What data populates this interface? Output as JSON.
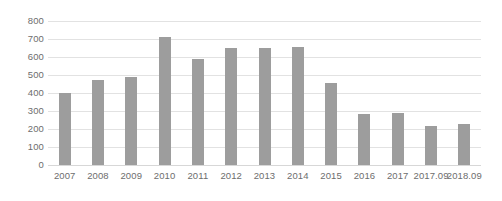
{
  "chart_data": {
    "type": "bar",
    "title": "",
    "subtitle": "",
    "xlabel": "",
    "ylabel": "",
    "categories": [
      "2007",
      "2008",
      "2009",
      "2010",
      "2011",
      "2012",
      "2013",
      "2014",
      "2015",
      "2016",
      "2017",
      "2017.09",
      "2018.09"
    ],
    "values": [
      398,
      472,
      490,
      712,
      588,
      652,
      650,
      658,
      458,
      282,
      288,
      215,
      230
    ],
    "ylim": [
      0,
      800
    ],
    "yticks": [
      0,
      100,
      200,
      300,
      400,
      500,
      600,
      700,
      800
    ],
    "ytick_labels": [
      "0",
      "100",
      "200",
      "300",
      "400",
      "500",
      "600",
      "700",
      "800"
    ],
    "grid": true,
    "legend": false,
    "legend_position": "none",
    "series": [
      {
        "name": "",
        "values": [
          398,
          472,
          490,
          712,
          588,
          652,
          650,
          658,
          458,
          282,
          288,
          215,
          230
        ]
      }
    ]
  },
  "style": {
    "bar_color": "#9d9d9d",
    "gridline_color": "#e2e2e2",
    "baseline_color": "#d7d7d7",
    "tick_label_color": "#6d6d6d",
    "background": "#ffffff"
  }
}
